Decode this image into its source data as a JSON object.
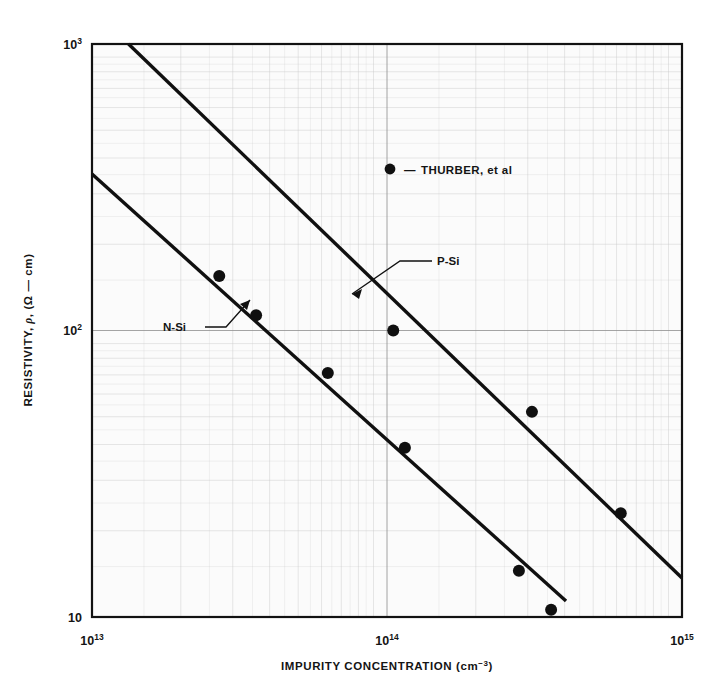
{
  "chart_data": {
    "type": "line",
    "title": "",
    "xlabel": "IMPURITY CONCENTRATION (cm−3)",
    "ylabel": "RESISTIVITY, ρ, (Ω — cm)",
    "xscale": "log",
    "yscale": "log",
    "xlim": [
      10000000000000.0,
      1000000000000000.0
    ],
    "ylim": [
      10,
      1000
    ],
    "grid": "log-log minor grid, on",
    "xticks": [
      {
        "value": 10000000000000.0,
        "label": "10",
        "exponent": "13"
      },
      {
        "value": 100000000000000.0,
        "label": "10",
        "exponent": "14"
      },
      {
        "value": 1000000000000000.0,
        "label": "10",
        "exponent": "15"
      }
    ],
    "yticks": [
      {
        "value": 1000,
        "label": "10",
        "exponent": "3"
      },
      {
        "value": 100,
        "label": "10",
        "exponent": "2"
      },
      {
        "value": 10,
        "label": "10",
        "exponent": ""
      }
    ],
    "series": [
      {
        "name": "P-Si",
        "label": "P-Si",
        "kind": "fit-line",
        "color": "#101010",
        "x": [
          12900000000000.0,
          1000000000000000.0
        ],
        "y": [
          1000,
          14.2
        ],
        "note": "straight line on log-log, spans from top edge to right edge"
      },
      {
        "name": "N-Si",
        "label": "N-Si",
        "kind": "fit-line",
        "color": "#101010",
        "x": [
          10000000000000.0,
          395000000000000.0
        ],
        "y": [
          420,
          10.2
        ],
        "note": "straight line on log-log, spans from left edge to bottom edge"
      }
    ],
    "scatter": [
      {
        "name": "THURBER, et al",
        "marker": "filled-circle",
        "color": "#101010",
        "points": [
          {
            "x": 27000000000000.0,
            "y": 155
          },
          {
            "x": 36000000000000.0,
            "y": 113
          },
          {
            "x": 63000000000000.0,
            "y": 71
          },
          {
            "x": 105000000000000.0,
            "y": 100
          },
          {
            "x": 115000000000000.0,
            "y": 39
          },
          {
            "x": 280000000000000.0,
            "y": 14.5
          },
          {
            "x": 360000000000000.0,
            "y": 10.6
          },
          {
            "x": 310000000000000.0,
            "y": 52
          },
          {
            "x": 620000000000000.0,
            "y": 23
          }
        ]
      }
    ],
    "legend": {
      "position": "upper-center-right",
      "entries": [
        {
          "marker": "filled-circle",
          "dash": "—",
          "label": "THURBER, et al"
        }
      ]
    },
    "annotations": [
      {
        "text": "P-Si",
        "target_series": "P-Si",
        "leader": true
      },
      {
        "text": "N-Si",
        "target_series": "N-Si",
        "leader": true
      }
    ]
  },
  "axes": {
    "y_title_main": "RESISTIVITY,",
    "y_title_rho": "ρ",
    "y_title_unit": ", (Ω — cm)",
    "x_title_main": "IMPURITY CONCENTRATION (cm",
    "x_title_exp": "−3",
    "x_title_tail": ")"
  },
  "labels": {
    "p_si": "P-Si",
    "n_si": "N-Si",
    "legend_dash": "—",
    "legend_text": "THURBER, et al",
    "y_top": "10",
    "y_top_exp": "3",
    "y_mid": "10",
    "y_mid_exp": "2",
    "y_bot": "10",
    "x_left": "10",
    "x_left_exp": "13",
    "x_mid": "10",
    "x_mid_exp": "14",
    "x_right": "10",
    "x_right_exp": "15"
  },
  "colors": {
    "ink": "#101010",
    "grid_minor": "#c9c9c9",
    "grid_major": "#8e8e8e",
    "plot_bg": "#fbfbfb",
    "page_bg": "#ffffff"
  }
}
